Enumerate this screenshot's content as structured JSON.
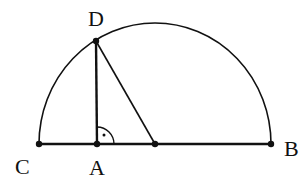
{
  "diagram": {
    "type": "geometry",
    "points": {
      "C": {
        "label": "C",
        "x": 39,
        "y": 144
      },
      "A": {
        "label": "A",
        "x": 97,
        "y": 144
      },
      "O": {
        "label": "",
        "x": 155,
        "y": 144
      },
      "B": {
        "label": "B",
        "x": 271,
        "y": 144
      },
      "D": {
        "label": "D",
        "x": 96,
        "y": 41
      }
    },
    "right_angle_at": "A",
    "colors": {
      "stroke": "#111111",
      "background": "#ffffff"
    }
  }
}
